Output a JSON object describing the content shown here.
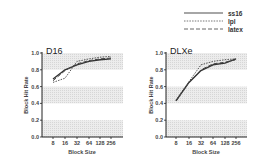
{
  "legend": {
    "items": [
      {
        "label": "ss16",
        "style": "solid"
      },
      {
        "label": "lpl",
        "style": "dotted"
      },
      {
        "label": "latex",
        "style": "dashed"
      }
    ]
  },
  "chart_data": [
    {
      "type": "line",
      "title": "D16",
      "xlabel": "Block Size",
      "ylabel": "Block Hit Rate",
      "categories": [
        "8",
        "16",
        "32",
        "64",
        "128",
        "256"
      ],
      "yticks": [
        "0.0",
        "0.2",
        "0.4",
        "0.6",
        "0.8",
        "1.0"
      ],
      "ylim": [
        0,
        1.0
      ],
      "shaded_bands": [
        [
          0,
          0.2
        ],
        [
          0.4,
          0.6
        ],
        [
          0.8,
          1.0
        ]
      ],
      "series": [
        {
          "name": "ss16",
          "values": [
            0.69,
            0.8,
            0.86,
            0.9,
            0.92,
            0.93
          ]
        },
        {
          "name": "lpl",
          "values": [
            0.65,
            0.7,
            0.9,
            0.93,
            0.95,
            0.96
          ]
        },
        {
          "name": "latex",
          "values": [
            0.67,
            0.79,
            0.87,
            0.91,
            0.93,
            0.94
          ]
        }
      ]
    },
    {
      "type": "line",
      "title": "DLXe",
      "xlabel": "Block Size",
      "ylabel": "Block Hit Rate",
      "categories": [
        "8",
        "16",
        "32",
        "64",
        "128",
        "256"
      ],
      "yticks": [
        "0.0",
        "0.2",
        "0.4",
        "0.6",
        "0.8",
        "1.0"
      ],
      "ylim": [
        0,
        1.0
      ],
      "shaded_bands": [
        [
          0,
          0.2
        ],
        [
          0.4,
          0.6
        ],
        [
          0.8,
          1.0
        ]
      ],
      "series": [
        {
          "name": "ss16",
          "values": [
            0.43,
            0.65,
            0.79,
            0.86,
            0.88,
            0.93
          ]
        },
        {
          "name": "lpl",
          "values": [
            0.44,
            0.66,
            0.86,
            0.9,
            0.92,
            0.93
          ]
        },
        {
          "name": "latex",
          "values": [
            0.43,
            0.65,
            0.8,
            0.87,
            0.89,
            0.92
          ]
        }
      ]
    }
  ]
}
